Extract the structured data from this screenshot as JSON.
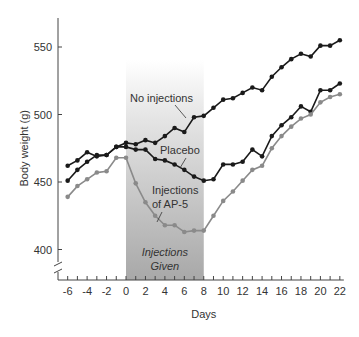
{
  "chart_data": {
    "type": "line",
    "title": "",
    "xlabel": "Days",
    "ylabel": "Body weight (g)",
    "x": [
      -6,
      -5,
      -4,
      -3,
      -2,
      -1,
      0,
      1,
      2,
      3,
      4,
      5,
      6,
      7,
      8,
      9,
      10,
      11,
      12,
      13,
      14,
      15,
      16,
      17,
      18,
      19,
      20,
      21,
      22
    ],
    "x_ticks": [
      -6,
      -4,
      -2,
      0,
      2,
      4,
      6,
      8,
      10,
      12,
      14,
      16,
      18,
      20,
      22
    ],
    "y_ticks": [
      400,
      450,
      500,
      550
    ],
    "ylim": [
      385,
      575
    ],
    "axis_break": true,
    "grid": false,
    "shaded_region": {
      "x_start": 0,
      "x_end": 8,
      "label_line1": "Injections",
      "label_line2": "Given"
    },
    "series": [
      {
        "name": "No injections",
        "color": "#1a1a1a",
        "values": [
          462,
          466,
          472,
          469,
          470,
          476,
          479,
          478,
          481,
          479,
          484,
          490,
          487,
          498,
          499,
          505,
          511,
          512,
          516,
          520,
          518,
          528,
          535,
          541,
          545,
          543,
          551,
          551,
          555
        ]
      },
      {
        "name": "Placebo",
        "color": "#1a1a1a",
        "values": [
          451,
          459,
          465,
          470,
          470,
          476,
          476,
          474,
          474,
          467,
          466,
          463,
          459,
          454,
          451,
          452,
          463,
          463,
          465,
          474,
          469,
          484,
          492,
          498,
          506,
          502,
          518,
          518,
          523
        ]
      },
      {
        "name": "Injections of AP-5",
        "color": "#8a8a8a",
        "values": [
          439,
          447,
          452,
          457,
          458,
          468,
          468,
          449,
          435,
          425,
          418,
          418,
          413,
          414,
          414,
          425,
          436,
          443,
          451,
          459,
          462,
          475,
          484,
          491,
          497,
          500,
          509,
          513,
          515
        ]
      }
    ],
    "annotations": [
      {
        "text": "No injections",
        "x": 8,
        "y": 505
      },
      {
        "text": "Placebo",
        "x": 10,
        "y": 470
      },
      {
        "text": "Injections",
        "x": 9,
        "y": 445
      },
      {
        "text": "of AP-5",
        "x": 9,
        "y": 435
      }
    ]
  }
}
